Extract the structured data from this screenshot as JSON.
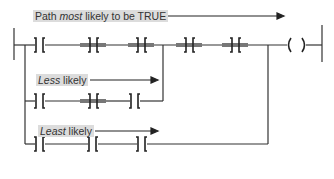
{
  "labels": {
    "most": {
      "pre": "Path ",
      "em": "most",
      "post": " likely to be TRUE"
    },
    "less": {
      "em": "Less",
      "post": " likely"
    },
    "least": {
      "em": "Least",
      "post": " likely"
    }
  },
  "colors": {
    "line": "#333333",
    "highlight": "#777777",
    "label_bg": "#dcdcdc"
  },
  "rungs": [
    {
      "name": "most-likely-path",
      "contacts": 5,
      "highlighted_contacts": [
        2,
        3,
        4,
        5
      ]
    },
    {
      "name": "less-likely-path",
      "contacts": 3,
      "highlighted_contacts": [
        2
      ]
    },
    {
      "name": "least-likely-path",
      "contacts": 3,
      "highlighted_contacts": []
    }
  ],
  "output": {
    "symbol": "( )"
  }
}
